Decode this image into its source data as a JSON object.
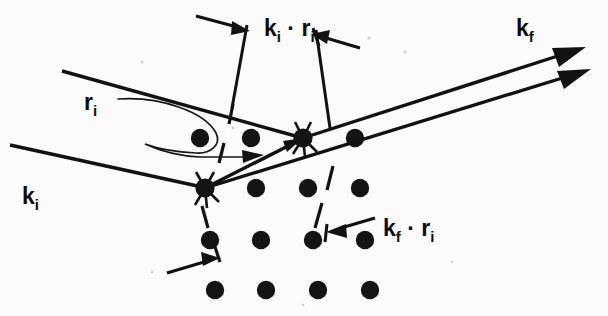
{
  "figure": {
    "background_color": "#fbfbfb",
    "ink_color": "#121212",
    "width": 608,
    "height": 316
  },
  "labels": {
    "k_i": {
      "base": "k",
      "sub": "i",
      "x": 22,
      "y": 196
    },
    "k_f": {
      "base": "k",
      "sub": "f",
      "x": 516,
      "y": 28
    },
    "r_i": {
      "base": "r",
      "sub": "i",
      "x": 84,
      "y": 102
    },
    "ki_dot_ri": {
      "base1": "k",
      "sub1": "i",
      "dot": "·",
      "base2": "r",
      "sub2": "i",
      "x": 264,
      "y": 28
    },
    "kf_dot_ri": {
      "base1": "k",
      "sub1": "f",
      "dot": "·",
      "base2": "r",
      "sub2": "i",
      "x": 383,
      "y": 228
    }
  },
  "scattering_centers": [
    {
      "name": "lower-scattering-center",
      "x": 205,
      "y": 188,
      "r": 9
    },
    {
      "name": "upper-scattering-center",
      "x": 303,
      "y": 138,
      "r": 9
    }
  ],
  "lattice": {
    "rows": 4,
    "cols": 4,
    "origin_x": 200,
    "origin_y": 138,
    "dx": 51,
    "dy": 41,
    "radius": 9,
    "dots": [
      {
        "x": 200,
        "y": 138
      },
      {
        "x": 251,
        "y": 138
      },
      {
        "x": 303,
        "y": 138
      },
      {
        "x": 355,
        "y": 138
      },
      {
        "x": 205,
        "y": 188
      },
      {
        "x": 256,
        "y": 188
      },
      {
        "x": 308,
        "y": 188
      },
      {
        "x": 360,
        "y": 188
      },
      {
        "x": 210,
        "y": 240
      },
      {
        "x": 261,
        "y": 240
      },
      {
        "x": 313,
        "y": 240
      },
      {
        "x": 365,
        "y": 240
      },
      {
        "x": 215,
        "y": 290
      },
      {
        "x": 266,
        "y": 290
      },
      {
        "x": 318,
        "y": 290
      },
      {
        "x": 370,
        "y": 290
      }
    ]
  },
  "rays": {
    "incoming_upper": {
      "x1": 62,
      "y1": 71,
      "x2": 303,
      "y2": 138
    },
    "incoming_lower": {
      "x1": 10,
      "y1": 145,
      "x2": 205,
      "y2": 188
    },
    "outgoing_upper": {
      "x1": 303,
      "y1": 138,
      "x2": 583,
      "y2": 48
    },
    "outgoing_lower": {
      "x1": 205,
      "y1": 188,
      "x2": 588,
      "y2": 70
    },
    "internal_segment": {
      "x1": 205,
      "y1": 188,
      "x2": 303,
      "y2": 138
    }
  },
  "planes": [
    {
      "name": "upper-lattice-plane",
      "x1": 232,
      "y1": 108,
      "x2": 216,
      "y2": 166
    },
    {
      "name": "middle-lattice-plane",
      "x1": 330,
      "y1": 170,
      "x2": 310,
      "y2": 232
    },
    {
      "name": "lower-lattice-plane",
      "x1": 200,
      "y1": 205,
      "x2": 224,
      "y2": 268
    }
  ],
  "markers": [
    {
      "name": "ki-ri-path-difference-arrow",
      "direction": "right"
    },
    {
      "name": "ki-ri-upper-arrow",
      "direction": "left"
    },
    {
      "name": "kf-ri-arrow",
      "direction": "left"
    },
    {
      "name": "lower-path-difference-arrow",
      "direction": "right"
    }
  ]
}
